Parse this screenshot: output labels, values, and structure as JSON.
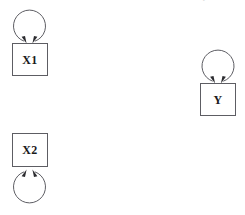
{
  "diagram": {
    "title_strip": "structural model with residual variance loops",
    "background_color": "#ffffff",
    "stroke_color": "#5d5d63",
    "arrow_color": "#2b2b2f",
    "label_color": "#1a1a1a",
    "width": 245,
    "height": 215,
    "nodes": [
      {
        "id": "x1",
        "label": "X1",
        "shape": "rectangle",
        "x": 12,
        "y": 43,
        "width": 36,
        "height": 33,
        "loop": {
          "name": "self-loop",
          "position": "above",
          "cx": 29.5,
          "cy": 27,
          "radius": 16,
          "arrowheads": 2
        }
      },
      {
        "id": "y",
        "label": "Y",
        "shape": "rectangle",
        "x": 200,
        "y": 83,
        "width": 36,
        "height": 33,
        "loop": {
          "name": "self-loop",
          "position": "above",
          "cx": 218,
          "cy": 67,
          "radius": 16,
          "arrowheads": 2
        }
      },
      {
        "id": "x2",
        "label": "X2",
        "shape": "rectangle",
        "x": 12,
        "y": 133,
        "width": 36,
        "height": 34,
        "loop": {
          "name": "self-loop",
          "position": "below",
          "cx": 29.5,
          "cy": 186,
          "radius": 16,
          "arrowheads": 2
        }
      }
    ]
  }
}
